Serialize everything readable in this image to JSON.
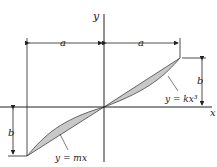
{
  "diagram": {
    "axes": {
      "x_label": "x",
      "y_label": "y"
    },
    "dimensions": {
      "left_width": "a",
      "right_width": "a",
      "right_height": "b",
      "left_height": "b"
    },
    "curves": {
      "upper_label": "y = kx³",
      "lower_label": "y = mx"
    },
    "colors": {
      "fill": "#c8c8c8",
      "stroke": "#333333",
      "line": "#222222"
    }
  }
}
